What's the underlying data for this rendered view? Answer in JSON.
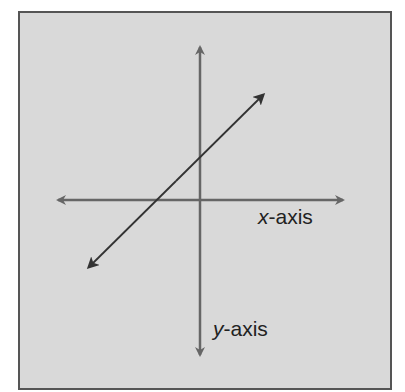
{
  "diagram": {
    "title": "",
    "labels": {
      "x_axis_var": "x",
      "x_axis_suffix": "-axis",
      "y_axis_var": "y",
      "y_axis_suffix": "-axis"
    },
    "elements": [
      {
        "type": "axis",
        "name": "x-axis",
        "direction": "horizontal",
        "double_headed": true
      },
      {
        "type": "axis",
        "name": "y-axis",
        "direction": "vertical",
        "double_headed": true
      },
      {
        "type": "line",
        "name": "diagonal-line",
        "slope": "positive",
        "double_headed": true,
        "crosses": "positive y-intercept"
      }
    ],
    "colors": {
      "background": "#d9d9d9",
      "border": "#555555",
      "axis": "#666666",
      "line": "#333333",
      "text": "#222222"
    }
  }
}
